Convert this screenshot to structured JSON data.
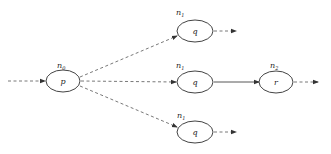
{
  "diagram": {
    "type": "graph",
    "nodes": [
      {
        "id": "p0",
        "label": "p",
        "annotation": "n",
        "annotation_index": "0",
        "cx": 63,
        "cy": 81
      },
      {
        "id": "q_top",
        "label": "q",
        "annotation": "n",
        "annotation_index": "1",
        "cx": 195,
        "cy": 31
      },
      {
        "id": "q_mid",
        "label": "q",
        "annotation": "n",
        "annotation_index": "1",
        "cx": 195,
        "cy": 82
      },
      {
        "id": "r",
        "label": "r",
        "annotation": "n",
        "annotation_index": "2",
        "cx": 276,
        "cy": 82
      },
      {
        "id": "q_bot",
        "label": "q",
        "annotation": "n",
        "annotation_index": "1",
        "cx": 195,
        "cy": 132
      }
    ],
    "edges": [
      {
        "from": "input",
        "to": "p0",
        "style": "dashed"
      },
      {
        "from": "p0",
        "to": "q_top",
        "style": "dashed"
      },
      {
        "from": "p0",
        "to": "q_mid",
        "style": "dashed"
      },
      {
        "from": "p0",
        "to": "q_bot",
        "style": "dashed"
      },
      {
        "from": "q_top",
        "to": "output",
        "style": "dashed"
      },
      {
        "from": "q_mid",
        "to": "r",
        "style": "solid"
      },
      {
        "from": "r",
        "to": "output",
        "style": "dashed"
      },
      {
        "from": "q_bot",
        "to": "output",
        "style": "dashed"
      }
    ]
  },
  "labels": {
    "p0": {
      "node": "p",
      "ann": "n",
      "idx": "0"
    },
    "q_top": {
      "node": "q",
      "ann": "n",
      "idx": "1"
    },
    "q_mid": {
      "node": "q",
      "ann": "n",
      "idx": "1"
    },
    "r": {
      "node": "r",
      "ann": "n",
      "idx": "2"
    },
    "q_bot": {
      "node": "q",
      "ann": "n",
      "idx": "1"
    }
  }
}
